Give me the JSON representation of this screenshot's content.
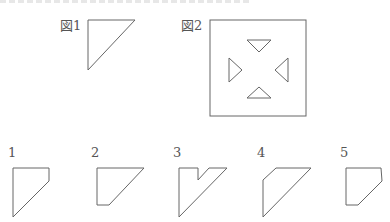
{
  "figures": {
    "fig1": {
      "label": "図1",
      "shape": "right-triangle"
    },
    "fig2": {
      "label": "図2",
      "shape": "square-with-four-inward-triangle-cutouts"
    }
  },
  "options": [
    {
      "label": "1",
      "shape": "pentagon-clipped-top-right"
    },
    {
      "label": "2",
      "shape": "quad-flat-bottom"
    },
    {
      "label": "3",
      "shape": "v-notched"
    },
    {
      "label": "4",
      "shape": "quad-clipped-top-left"
    },
    {
      "label": "5",
      "shape": "pentagon-clipped-corners"
    }
  ]
}
